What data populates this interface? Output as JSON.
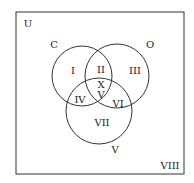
{
  "diagram": {
    "type": "venn",
    "universe_label": "U",
    "sets": [
      {
        "name": "C",
        "label": "C"
      },
      {
        "name": "O",
        "label": "O"
      },
      {
        "name": "V",
        "label": "V"
      }
    ],
    "regions": {
      "r1": "I",
      "r2": "II",
      "r3": "III",
      "r4": "IV",
      "r5a": "X",
      "r5b": "V",
      "r6": "VI",
      "r7": "VII",
      "r8": "VIII"
    },
    "colors": {
      "stroke": "#333333",
      "background": "#ffffff"
    }
  }
}
